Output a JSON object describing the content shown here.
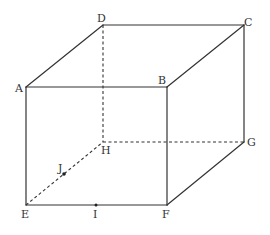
{
  "figure": {
    "type": "cube",
    "colors": {
      "line": "#333333",
      "label": "#333333",
      "background": "#ffffff"
    },
    "vertices": [
      {
        "id": "A",
        "label": "A"
      },
      {
        "id": "B",
        "label": "B"
      },
      {
        "id": "C",
        "label": "C"
      },
      {
        "id": "D",
        "label": "D"
      },
      {
        "id": "E",
        "label": "E"
      },
      {
        "id": "F",
        "label": "F"
      },
      {
        "id": "G",
        "label": "G"
      },
      {
        "id": "H",
        "label": "H"
      }
    ],
    "points": [
      {
        "id": "I",
        "label": "I",
        "on_edge": "EF"
      },
      {
        "id": "J",
        "label": "J",
        "on_edge": "EH"
      }
    ],
    "visible_edges": [
      "AB",
      "BC",
      "CD",
      "DA",
      "AE",
      "BF",
      "CG",
      "EF",
      "FG"
    ],
    "hidden_edges": [
      "DH",
      "EH",
      "HG"
    ]
  }
}
